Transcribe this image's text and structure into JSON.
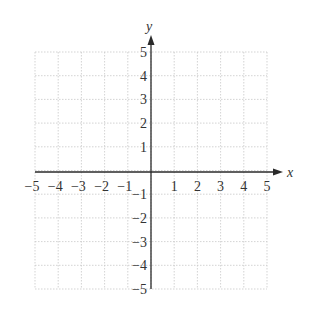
{
  "chart_data": {
    "type": "scatter",
    "title": "",
    "xlabel": "x",
    "ylabel": "y",
    "xlim": [
      -5,
      5
    ],
    "ylim": [
      -5,
      5
    ],
    "grid": true,
    "x_ticks": [
      -5,
      -4,
      -3,
      -2,
      -1,
      1,
      2,
      3,
      4,
      5
    ],
    "y_ticks": [
      -5,
      -4,
      -3,
      -2,
      -1,
      1,
      2,
      3,
      4,
      5
    ],
    "x_tick_labels": [
      "−5",
      "−4",
      "−3",
      "−2",
      "−1",
      "1",
      "2",
      "3",
      "4",
      "5"
    ],
    "y_tick_labels": [
      "−5",
      "−4",
      "−3",
      "−2",
      "−1",
      "1",
      "2",
      "3",
      "4",
      "5"
    ],
    "series": [],
    "legend": null
  },
  "axes": {
    "x_label": "x",
    "y_label": "y"
  },
  "colors": {
    "axis": "#2a2a2a",
    "grid": "#c8c8c8",
    "text": "#333333"
  }
}
